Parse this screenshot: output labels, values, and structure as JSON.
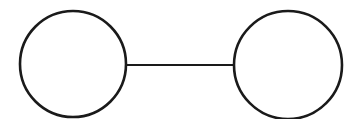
{
  "diagram": {
    "type": "graph",
    "stroke_color": "#1a1a1a",
    "fill_color": "#ffffff",
    "nodes": [
      {
        "id": "left",
        "cx": 73,
        "cy": 64,
        "r": 53
      },
      {
        "id": "right",
        "cx": 288,
        "cy": 65,
        "r": 54
      }
    ],
    "edges": [
      {
        "from": "left",
        "to": "right",
        "x1": 126,
        "y1": 65,
        "x2": 234,
        "y2": 65
      }
    ]
  }
}
